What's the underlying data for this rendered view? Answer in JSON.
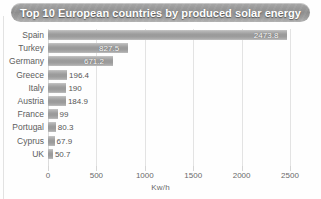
{
  "title": "Top 10 European countries by produced solar energy",
  "axis_title": "Kw/h",
  "colors": {
    "banner": "#9b9b9b",
    "bar": "#9c9c9c",
    "gridline": "#e3e3e3",
    "label_text": "#5d5d5d",
    "title_text": "#ffffff"
  },
  "chart_data": {
    "type": "bar",
    "orientation": "horizontal",
    "title": "Top 10 European countries by produced solar energy",
    "xlabel": "Kw/h",
    "ylabel": "",
    "xlim": [
      0,
      2500
    ],
    "grid": true,
    "legend": false,
    "xticks": [
      0,
      500,
      1000,
      1500,
      2000,
      2500
    ],
    "xtick_labels": [
      "0",
      "500",
      "1000",
      "1500",
      "2000",
      "2500"
    ],
    "categories": [
      "Spain",
      "Turkey",
      "Germany",
      "Greece",
      "Italy",
      "Austria",
      "France",
      "Portugal",
      "Cyprus",
      "UK"
    ],
    "values": [
      2473.8,
      827.5,
      671.2,
      196.4,
      190,
      184.9,
      99,
      80.3,
      67.9,
      50.7
    ],
    "value_labels": [
      "2473.8",
      "827.5",
      "671.2",
      "196.4",
      "190",
      "184.9",
      "99",
      "80.3",
      "67.9",
      "50.7"
    ]
  }
}
